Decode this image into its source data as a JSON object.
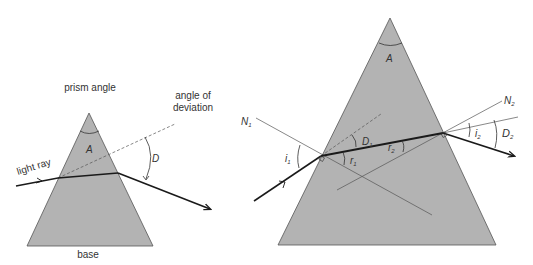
{
  "colors": {
    "prism_fill": "#b3b3b3",
    "prism_edge": "#555555",
    "ray": "#1a1a1a",
    "thin_line": "#555555",
    "text": "#333333"
  },
  "left_diagram": {
    "title": "prism angle",
    "light_ray_label": "light ray",
    "deviation_label_line1": "angle of",
    "deviation_label_line2": "deviation",
    "base_label": "base",
    "apex_angle": "A",
    "deviation_angle": "D"
  },
  "right_diagram": {
    "apex_angle": "A",
    "normal_1": "N",
    "normal_1_sub": "1",
    "normal_2": "N",
    "normal_2_sub": "2",
    "incidence_1": "i",
    "incidence_1_sub": "1",
    "refraction_1": "r",
    "refraction_1_sub": "1",
    "refraction_2": "r",
    "refraction_2_sub": "2",
    "emergence_2": "i",
    "emergence_2_sub": "2",
    "deviation_1": "D",
    "deviation_1_sub": "1",
    "deviation_2": "D",
    "deviation_2_sub": "2"
  }
}
